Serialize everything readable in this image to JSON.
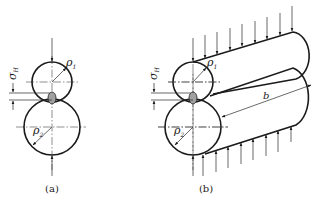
{
  "figure": {
    "panels": [
      {
        "id": "a",
        "caption": "(a)",
        "labels": {
          "stress": "σ",
          "stress_sub": "H",
          "rho1": "ρ",
          "rho1_sub": "1",
          "rho2": "ρ",
          "rho2_sub": "2"
        },
        "description": "Two cylinders in contact, cross-section view with contact stress zone"
      },
      {
        "id": "b",
        "caption": "(b)",
        "labels": {
          "stress": "σ",
          "stress_sub": "H",
          "rho1": "ρ",
          "rho1_sub": "1",
          "rho2": "ρ",
          "rho2_sub": "2",
          "length": "b"
        },
        "description": "Two cylinders in contact, isometric view with distributed load along length b"
      }
    ],
    "colors": {
      "line": "#1a1a1a",
      "contact_fill": "#a0a0a0"
    }
  }
}
